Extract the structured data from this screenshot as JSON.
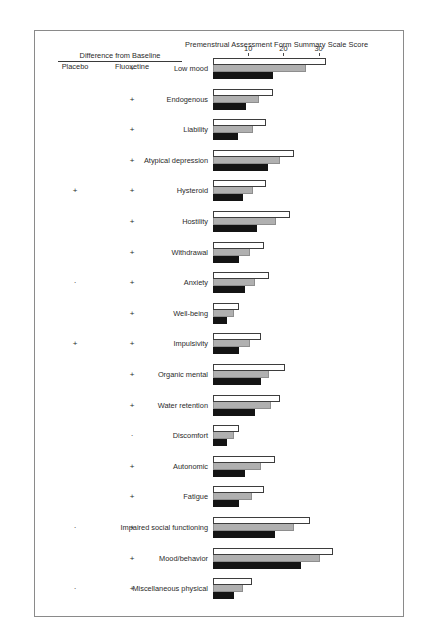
{
  "chart_data": {
    "type": "bar",
    "orientation": "horizontal",
    "title": "Premenstrual Assessment Form Summary Scale Score",
    "xlabel": "",
    "ylabel": "",
    "xlim": [
      0,
      36
    ],
    "grid": false,
    "legend_position": "none",
    "tick_values": [
      10,
      20,
      30
    ],
    "tick_labels": [
      "10",
      "20",
      "30"
    ],
    "categories": [
      "Low mood",
      "Endogenous",
      "Liability",
      "Atypical depression",
      "Hysteroid",
      "Hostility",
      "Withdrawal",
      "Anxiety",
      "Well-being",
      "Impulsivity",
      "Organic mental",
      "Water retention",
      "Discomfort",
      "Autonomic",
      "Fatigue",
      "Impaired social functioning",
      "Mood/behavior",
      "Miscellaneous physical"
    ],
    "series": [
      {
        "name": "white",
        "color": "#ffffff",
        "values": [
          32.0,
          17.0,
          15.0,
          23.0,
          15.0,
          22.0,
          14.5,
          16.0,
          7.5,
          13.5,
          20.5,
          19.0,
          7.5,
          17.5,
          14.5,
          27.5,
          34.0,
          11.0
        ]
      },
      {
        "name": "gray",
        "color": "#b0b0b0",
        "values": [
          26.5,
          13.0,
          11.5,
          19.0,
          11.5,
          18.0,
          10.5,
          12.0,
          6.0,
          10.5,
          16.0,
          16.5,
          6.0,
          13.5,
          11.0,
          23.0,
          30.5,
          8.5
        ]
      },
      {
        "name": "black",
        "color": "#141414",
        "values": [
          17.0,
          9.5,
          7.0,
          15.5,
          8.5,
          12.5,
          7.5,
          9.0,
          4.0,
          7.5,
          13.5,
          12.0,
          4.0,
          9.0,
          7.5,
          17.5,
          25.0,
          6.0
        ]
      }
    ]
  },
  "header": {
    "difference_title": "Difference from Baseline",
    "col_placebo": "Placebo",
    "col_fluoxetine": "Fluoxetine"
  },
  "significance": [
    {
      "category": "Low mood",
      "placebo": "",
      "fluoxetine": "+"
    },
    {
      "category": "Endogenous",
      "placebo": "",
      "fluoxetine": "+"
    },
    {
      "category": "Liability",
      "placebo": "",
      "fluoxetine": "+"
    },
    {
      "category": "Atypical depression",
      "placebo": "",
      "fluoxetine": "+"
    },
    {
      "category": "Hysteroid",
      "placebo": "+",
      "fluoxetine": "+"
    },
    {
      "category": "Hostility",
      "placebo": "",
      "fluoxetine": "+"
    },
    {
      "category": "Withdrawal",
      "placebo": "",
      "fluoxetine": "+"
    },
    {
      "category": "Anxiety",
      "placebo": "·",
      "fluoxetine": "+"
    },
    {
      "category": "Well-being",
      "placebo": "",
      "fluoxetine": "+"
    },
    {
      "category": "Impulsivity",
      "placebo": "+",
      "fluoxetine": "+"
    },
    {
      "category": "Organic mental",
      "placebo": "",
      "fluoxetine": "+"
    },
    {
      "category": "Water retention",
      "placebo": "",
      "fluoxetine": "+"
    },
    {
      "category": "Discomfort",
      "placebo": "",
      "fluoxetine": "·"
    },
    {
      "category": "Autonomic",
      "placebo": "",
      "fluoxetine": "+"
    },
    {
      "category": "Fatigue",
      "placebo": "",
      "fluoxetine": "+"
    },
    {
      "category": "Impaired social functioning",
      "placebo": "·",
      "fluoxetine": "+"
    },
    {
      "category": "Mood/behavior",
      "placebo": "",
      "fluoxetine": "+"
    },
    {
      "category": "Miscellaneous physical",
      "placebo": "·",
      "fluoxetine": "+"
    }
  ],
  "caption": ""
}
